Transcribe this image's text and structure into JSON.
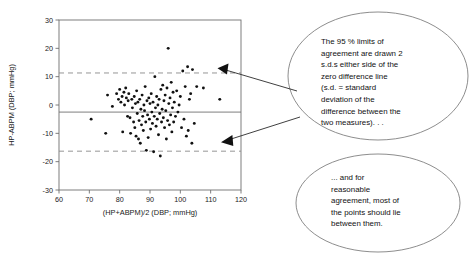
{
  "chart_data": {
    "type": "scatter",
    "title": "",
    "xlabel": "(HP+ABPM)/2 (DBP; mmHg)",
    "ylabel": "HP-ABPM (DBP; mmHg)",
    "xlim": [
      60,
      120
    ],
    "ylim": [
      -30,
      30
    ],
    "xticks": [
      60,
      70,
      80,
      90,
      100,
      110,
      120
    ],
    "yticks": [
      30,
      20,
      10,
      0,
      -10,
      -20,
      -30
    ],
    "grid": false,
    "legend": "none",
    "reference_lines": [
      {
        "name": "mean-difference-line",
        "style": "solid",
        "y": -2.5
      },
      {
        "name": "upper-limit-of-agreement",
        "style": "dashed",
        "y": 11.3
      },
      {
        "name": "lower-limit-of-agreement",
        "style": "dashed",
        "y": -16.3
      }
    ],
    "points": [
      [
        70.6,
        -5.0
      ],
      [
        75.4,
        -10.0
      ],
      [
        76.0,
        3.5
      ],
      [
        77.6,
        -0.5
      ],
      [
        79.0,
        4.0
      ],
      [
        79.6,
        2.0
      ],
      [
        80.0,
        5.5
      ],
      [
        80.4,
        1.0
      ],
      [
        80.8,
        3.0
      ],
      [
        81.0,
        -9.5
      ],
      [
        81.4,
        4.5
      ],
      [
        81.6,
        0.0
      ],
      [
        82.0,
        6.0
      ],
      [
        82.2,
        2.5
      ],
      [
        82.6,
        -4.0
      ],
      [
        82.8,
        1.5
      ],
      [
        83.0,
        4.0
      ],
      [
        83.4,
        -4.5
      ],
      [
        83.6,
        -10.0
      ],
      [
        84.0,
        2.0
      ],
      [
        84.2,
        -1.0
      ],
      [
        84.6,
        -6.0
      ],
      [
        84.8,
        3.0
      ],
      [
        85.0,
        -8.0
      ],
      [
        85.2,
        0.5
      ],
      [
        85.4,
        -11.0
      ],
      [
        85.6,
        5.0
      ],
      [
        85.8,
        -3.0
      ],
      [
        86.0,
        1.0
      ],
      [
        86.2,
        -12.0
      ],
      [
        86.4,
        -5.5
      ],
      [
        86.6,
        2.0
      ],
      [
        86.8,
        -13.5
      ],
      [
        87.0,
        -1.5
      ],
      [
        87.2,
        -7.0
      ],
      [
        87.4,
        3.5
      ],
      [
        87.6,
        -4.0
      ],
      [
        87.8,
        -9.0
      ],
      [
        88.0,
        0.0
      ],
      [
        88.2,
        -2.0
      ],
      [
        88.4,
        6.5
      ],
      [
        88.6,
        -6.0
      ],
      [
        88.8,
        -16.0
      ],
      [
        89.0,
        1.5
      ],
      [
        89.2,
        -3.5
      ],
      [
        89.4,
        -11.5
      ],
      [
        89.6,
        2.5
      ],
      [
        89.8,
        -5.0
      ],
      [
        90.0,
        0.5
      ],
      [
        90.2,
        -8.5
      ],
      [
        90.4,
        4.0
      ],
      [
        90.6,
        -2.5
      ],
      [
        90.8,
        -6.5
      ],
      [
        91.0,
        1.0
      ],
      [
        91.2,
        -16.5
      ],
      [
        91.4,
        -4.0
      ],
      [
        91.6,
        10.0
      ],
      [
        91.8,
        -1.0
      ],
      [
        92.0,
        -7.5
      ],
      [
        92.2,
        3.0
      ],
      [
        92.4,
        -5.0
      ],
      [
        92.6,
        0.0
      ],
      [
        92.8,
        -10.5
      ],
      [
        93.0,
        2.0
      ],
      [
        93.2,
        -3.0
      ],
      [
        93.4,
        -18.0
      ],
      [
        93.6,
        5.5
      ],
      [
        93.8,
        -6.0
      ],
      [
        94.0,
        -1.5
      ],
      [
        94.2,
        7.0
      ],
      [
        94.4,
        -4.5
      ],
      [
        94.6,
        1.5
      ],
      [
        94.8,
        -8.0
      ],
      [
        95.0,
        3.5
      ],
      [
        95.2,
        -2.0
      ],
      [
        95.4,
        -12.0
      ],
      [
        95.6,
        6.0
      ],
      [
        95.8,
        -5.5
      ],
      [
        96.0,
        20.0
      ],
      [
        96.2,
        0.5
      ],
      [
        96.4,
        -7.0
      ],
      [
        96.6,
        2.5
      ],
      [
        96.8,
        -3.5
      ],
      [
        97.0,
        8.0
      ],
      [
        97.2,
        -9.5
      ],
      [
        97.4,
        -1.0
      ],
      [
        97.6,
        4.5
      ],
      [
        97.8,
        -6.0
      ],
      [
        98.0,
        1.0
      ],
      [
        98.4,
        -4.0
      ],
      [
        98.8,
        5.0
      ],
      [
        99.2,
        -2.5
      ],
      [
        99.6,
        0.0
      ],
      [
        100.0,
        3.0
      ],
      [
        100.4,
        -8.0
      ],
      [
        100.8,
        12.0
      ],
      [
        101.2,
        -5.0
      ],
      [
        101.6,
        6.5
      ],
      [
        102.0,
        -11.0
      ],
      [
        102.4,
        13.5
      ],
      [
        102.6,
        -9.0
      ],
      [
        103.0,
        2.0
      ],
      [
        103.4,
        4.0
      ],
      [
        103.8,
        -13.5
      ],
      [
        104.0,
        12.5
      ],
      [
        104.6,
        -6.5
      ],
      [
        105.4,
        6.5
      ],
      [
        107.6,
        6.0
      ],
      [
        113.0,
        2.0
      ]
    ]
  },
  "callouts": [
    {
      "name": "limits-of-agreement-note",
      "lines": [
        "The 95 % limits of",
        "agreement are drawn 2",
        "s.d.s either side of the",
        "zero difference line",
        "(s.d. = standard",
        "deviation of the",
        "difference between the",
        "two measures). . ."
      ]
    },
    {
      "name": "reasonable-agreement-note",
      "lines": [
        "... and for",
        "reasonable",
        "agreement, most of",
        "the points should lie",
        "between them."
      ]
    }
  ],
  "colors": {
    "point": "#111111",
    "frame": "#6f6f6f",
    "dashed_line": "#8a8a8a",
    "callout_outline": "#707070",
    "background": "#ffffff"
  }
}
